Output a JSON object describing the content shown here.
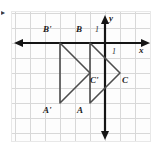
{
  "figure": {
    "corner_mark": "▸",
    "axes": {
      "x_label": "x",
      "y_label": "y",
      "x_tick_label": "1",
      "y_tick_label": "1",
      "origin_px": [
        93,
        31
      ],
      "unit_px": 15,
      "x_range": [
        -6.2,
        3.2
      ],
      "y_range": [
        -6.4,
        2.1
      ],
      "grid": true,
      "grid_color": "#d8d8d8",
      "axis_color": "#151515"
    },
    "shapes": [
      {
        "name": "triangle-abc",
        "stroke": "#4d4d4d",
        "vertices": [
          {
            "label": "B",
            "x": -1,
            "y": 0
          },
          {
            "label": "A",
            "x": -1,
            "y": -4
          },
          {
            "label": "C",
            "x": 1,
            "y": -2
          }
        ]
      },
      {
        "name": "triangle-a-prime-b-prime-c-prime",
        "stroke": "#4d4d4d",
        "vertices": [
          {
            "label": "B'",
            "x": -3,
            "y": 0
          },
          {
            "label": "A'",
            "x": -3,
            "y": -4
          },
          {
            "label": "C'",
            "x": -1,
            "y": -2
          }
        ]
      }
    ],
    "vertex_labels": [
      {
        "name": "label-b-prime",
        "text": "B'",
        "left": 30,
        "top": 25
      },
      {
        "name": "label-b",
        "text": "B",
        "left": 62,
        "top": 25
      },
      {
        "name": "label-c-prime",
        "text": "C'",
        "left": 88,
        "top": 76
      },
      {
        "name": "label-c",
        "text": "C",
        "left": 119,
        "top": 76
      },
      {
        "name": "label-a-prime",
        "text": "A'",
        "left": 29,
        "top": 105
      },
      {
        "name": "label-a",
        "text": "A",
        "left": 63,
        "top": 105
      }
    ],
    "axis_text": [
      {
        "name": "y-axis-label",
        "text": "y",
        "left": 110,
        "top": 13
      },
      {
        "name": "x-axis-label",
        "text": "x",
        "left": 139,
        "top": 45
      },
      {
        "name": "y-unit-label",
        "text": "1",
        "left": 95,
        "top": 25
      },
      {
        "name": "x-unit-label",
        "text": "1",
        "left": 112,
        "top": 47
      }
    ]
  }
}
